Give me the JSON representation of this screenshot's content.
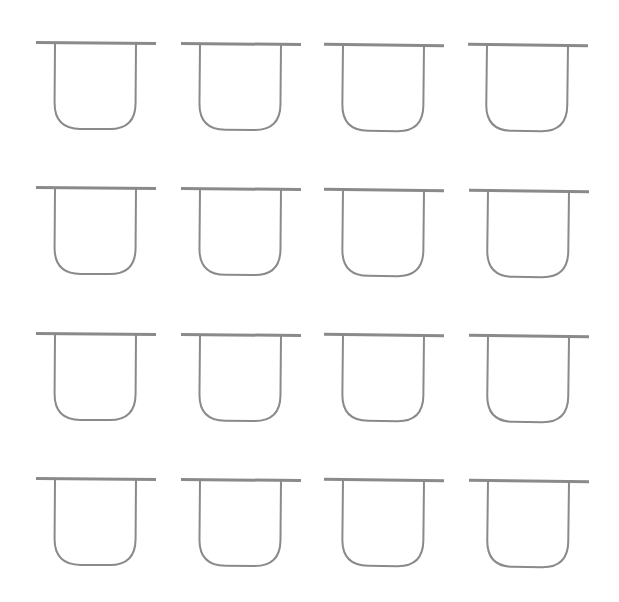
{
  "diagram": {
    "type": "shape-grid",
    "rows": 4,
    "columns": 4,
    "shape_name": "u-cup-with-top-bar",
    "colors": {
      "stroke": "#8a8a8a",
      "background": "#ffffff"
    },
    "bar_thickness": 3,
    "stroke_width": 2,
    "shape_size": {
      "bar_width": 120,
      "u_left_offset": 19,
      "u_width": 81,
      "u_height": 86,
      "corner_radius": 26
    },
    "shapes": [
      {
        "row": 1,
        "col": 1,
        "x": 36,
        "y": 43,
        "tilt": 0.4
      },
      {
        "row": 1,
        "col": 2,
        "x": 181,
        "y": 44,
        "tilt": 0.5
      },
      {
        "row": 1,
        "col": 3,
        "x": 324,
        "y": 45,
        "tilt": 0.6
      },
      {
        "row": 1,
        "col": 4,
        "x": 468,
        "y": 45,
        "tilt": 0.7
      },
      {
        "row": 2,
        "col": 1,
        "x": 36,
        "y": 188,
        "tilt": 0.4
      },
      {
        "row": 2,
        "col": 2,
        "x": 181,
        "y": 189,
        "tilt": 0.5
      },
      {
        "row": 2,
        "col": 3,
        "x": 324,
        "y": 190,
        "tilt": 0.6
      },
      {
        "row": 2,
        "col": 4,
        "x": 469,
        "y": 191,
        "tilt": 0.7
      },
      {
        "row": 3,
        "col": 1,
        "x": 36,
        "y": 334,
        "tilt": 0.4
      },
      {
        "row": 3,
        "col": 2,
        "x": 181,
        "y": 335,
        "tilt": 0.5
      },
      {
        "row": 3,
        "col": 3,
        "x": 324,
        "y": 335,
        "tilt": 0.6
      },
      {
        "row": 3,
        "col": 4,
        "x": 469,
        "y": 336,
        "tilt": 0.7
      },
      {
        "row": 4,
        "col": 1,
        "x": 36,
        "y": 479,
        "tilt": 0.4
      },
      {
        "row": 4,
        "col": 2,
        "x": 181,
        "y": 480,
        "tilt": 0.5
      },
      {
        "row": 4,
        "col": 3,
        "x": 324,
        "y": 480,
        "tilt": 0.6
      },
      {
        "row": 4,
        "col": 4,
        "x": 469,
        "y": 481,
        "tilt": 0.7
      }
    ]
  }
}
